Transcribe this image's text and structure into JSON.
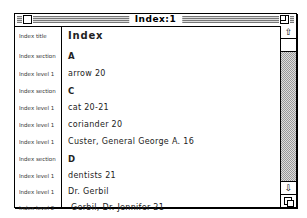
{
  "window": {
    "title": "Index:1"
  },
  "rows": [
    {
      "style": "Index title",
      "text": "Index",
      "kind": "title"
    },
    {
      "style": "Index section",
      "text": "A",
      "kind": "section"
    },
    {
      "style": "Index level 1",
      "text": "arrow 20",
      "kind": "l1"
    },
    {
      "style": "Index section",
      "text": "C",
      "kind": "section"
    },
    {
      "style": "Index level 1",
      "text": "cat  20-21",
      "kind": "l1"
    },
    {
      "style": "Index level 1",
      "text": "coriander  20",
      "kind": "l1"
    },
    {
      "style": "Index level 1",
      "text": "Custer, General George A. 16",
      "kind": "l1"
    },
    {
      "style": "Index section",
      "text": "D",
      "kind": "section"
    },
    {
      "style": "Index level 1",
      "text": "dentists  21",
      "kind": "l1"
    },
    {
      "style": "Index level 1",
      "text": "Dr. Gerbil",
      "kind": "l1"
    },
    {
      "style": "Index level 2",
      "text": "Gerbil, Dr. Jennifer  21",
      "kind": "l2"
    }
  ],
  "scrollbar": {
    "up_arrow": "⇧",
    "down_arrow": "⇩"
  }
}
